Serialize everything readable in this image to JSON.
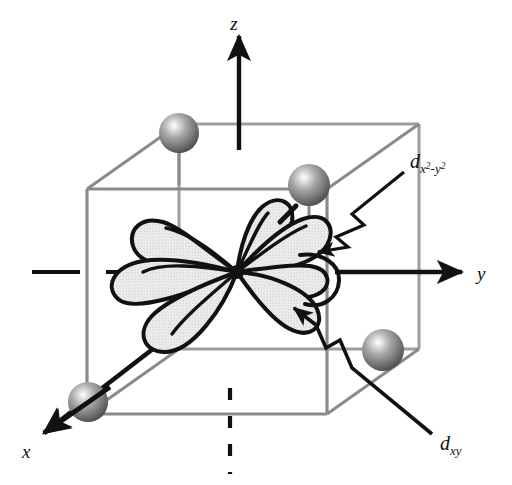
{
  "figure": {
    "kind": "crystal-field-orbital-diagram",
    "background_color": "#ffffff"
  },
  "axes": [
    {
      "id": "z",
      "label": "z",
      "direction": "up",
      "style": "solid-arrow",
      "color": "#111111",
      "label_x": 234,
      "label_y": 22,
      "arrow_from_x": 239,
      "arrow_from_y": 150,
      "arrow_to_x": 239,
      "arrow_to_y": 33
    },
    {
      "id": "y",
      "label": "y",
      "direction": "right",
      "style": "solid-arrow",
      "color": "#111111",
      "label_x": 478,
      "label_y": 280,
      "arrow_from_x": 335,
      "arrow_from_y": 272,
      "arrow_to_x": 465,
      "arrow_to_y": 272
    },
    {
      "id": "x",
      "label": "x",
      "direction": "down-left",
      "style": "solid-arrow",
      "color": "#111111",
      "label_x": 24,
      "label_y": 452,
      "arrow_from_x": 178,
      "arrow_from_y": 330,
      "arrow_to_x": 40,
      "arrow_to_y": 436
    },
    {
      "id": "z-negative",
      "label": "",
      "direction": "down",
      "style": "dashed",
      "color": "#111111"
    },
    {
      "id": "y-negative",
      "label": "",
      "direction": "left",
      "style": "dashed",
      "color": "#111111"
    }
  ],
  "cube": {
    "edge_color": "#8a8a8a",
    "edge_color_hidden": "#9d9d9d",
    "edge_width": 3,
    "front_face": {
      "left": 87,
      "top": 189,
      "right": 327,
      "bottom": 414
    },
    "back_offset_x": 92,
    "back_offset_y": -65
  },
  "spheres": [
    {
      "id": "ligand-top-back-left",
      "cx": 179,
      "cy": 133,
      "r": 20,
      "fill_light": "#f0f0f0",
      "fill_mid": "#8e8e8e",
      "fill_dark": "#4b4b4b"
    },
    {
      "id": "ligand-top-back-right",
      "cx": 309,
      "cy": 185,
      "r": 21,
      "fill_light": "#f0f0f0",
      "fill_mid": "#8e8e8e",
      "fill_dark": "#4b4b4b"
    },
    {
      "id": "ligand-bottom-front-right",
      "cx": 383,
      "cy": 350,
      "r": 21,
      "fill_light": "#f0f0f0",
      "fill_mid": "#8e8e8e",
      "fill_dark": "#4b4b4b"
    },
    {
      "id": "ligand-bottom-front-left",
      "cx": 88,
      "cy": 402,
      "r": 20,
      "fill_light": "#f0f0f0",
      "fill_mid": "#8e8e8e",
      "fill_dark": "#4b4b4b"
    }
  ],
  "orbitals": {
    "center_x": 237,
    "center_y": 272,
    "lobe_fill": "#e6e6e6",
    "lobe_stroke": "#111111",
    "lobe_stroke_width": 4,
    "center_dot_r": 7
  },
  "callouts": [
    {
      "id": "dx2y2",
      "label_base": "d",
      "label_sub_1": "x",
      "label_sup_1": "2",
      "label_sep": "-",
      "label_sub_2": "y",
      "label_sup_2": "2",
      "label_text": "dx2-y2",
      "label_x": 414,
      "label_y": 163,
      "arrow_color": "#111111",
      "arrow_tip_x": 312,
      "arrow_tip_y": 255,
      "has_zigzag": true
    },
    {
      "id": "dxy",
      "label_base": "d",
      "label_sub_1": "xy",
      "label_text": "dxy",
      "label_x": 443,
      "label_y": 444,
      "arrow_color": "#111111",
      "arrow_tip_x": 282,
      "arrow_tip_y": 302,
      "has_zigzag": true
    }
  ]
}
